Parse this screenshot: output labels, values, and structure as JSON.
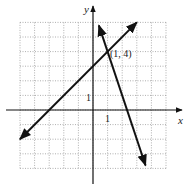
{
  "chart_data": {
    "type": "line",
    "title": "",
    "xlabel": "x",
    "ylabel": "y",
    "xlim": [
      -5,
      5
    ],
    "ylim": [
      -4,
      6
    ],
    "grid": true,
    "tick_labels": {
      "x": "1",
      "y": "1"
    },
    "series": [
      {
        "name": "line-1",
        "equation": "y = x + 3",
        "points": [
          [
            -5,
            -2
          ],
          [
            3,
            6
          ]
        ],
        "arrows": "both"
      },
      {
        "name": "line-2",
        "equation": "y = -3x + 7",
        "points": [
          [
            0.4,
            5.8
          ],
          [
            3.6,
            -3.8
          ]
        ],
        "arrows": "both"
      }
    ],
    "annotations": [
      {
        "text": "(1, 4)",
        "x": 1,
        "y": 4
      }
    ]
  },
  "labels": {
    "x_axis": "x",
    "y_axis": "y",
    "x_tick": "1",
    "y_tick": "1",
    "intersection": "(1, 4)"
  }
}
